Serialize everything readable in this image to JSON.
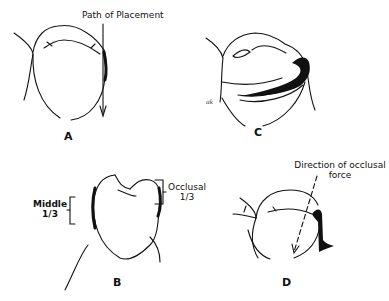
{
  "figure": {
    "panels": [
      {
        "id": "A",
        "label": "A",
        "annotation": "Path of Placement"
      },
      {
        "id": "B",
        "label": "B",
        "annotations": [
          {
            "text_line1": "Middle",
            "text_line2": "1/3"
          },
          {
            "text_line1": "Occlusal",
            "text_line2": "1/3"
          }
        ]
      },
      {
        "id": "C",
        "label": "C",
        "signature": "ak"
      },
      {
        "id": "D",
        "label": "D",
        "annotation_line1": "Direction of occlusal",
        "annotation_line2": "force"
      }
    ]
  }
}
